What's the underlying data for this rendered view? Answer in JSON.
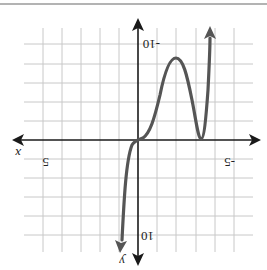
{
  "figure": {
    "orientation": "rotated-180",
    "colors": {
      "grid": "#c8c8c8",
      "axis": "#1a1a1a",
      "curve": "#555555",
      "border": "#9a9a9a",
      "background": "#ffffff"
    },
    "axes": {
      "x_label": "x",
      "y_label": "y",
      "x_tick_labels": {
        "left": "5",
        "right": "-5"
      },
      "y_tick_labels": {
        "top": "-10",
        "bottom": "10"
      }
    },
    "grid": {
      "x_step": 1,
      "y_step": 2,
      "x_range": [
        -5,
        5
      ],
      "y_range": [
        -10,
        10
      ]
    },
    "curve": {
      "description": "Polynomial with a triple/inflection zero at x=0 and a double zero at x=-3 (as labeled in the rotated frame); local extremum of magnitude about 8 between them.",
      "zeros": [
        0,
        -3
      ],
      "local_extremum": {
        "x": -1.8,
        "y": -8
      }
    }
  }
}
